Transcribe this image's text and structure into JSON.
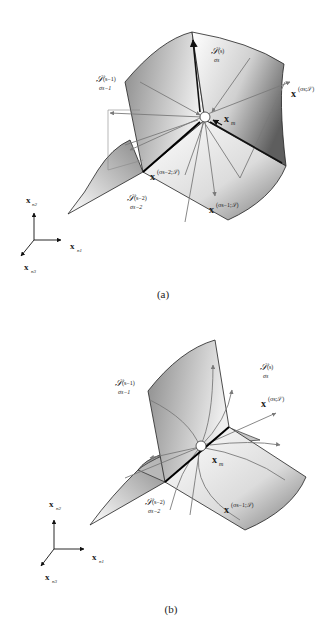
{
  "panels": [
    {
      "id": "a",
      "caption": "(a)",
      "labels": {
        "surface_s": "𝒮",
        "surface_s_sup": "(s)",
        "surface_s_sub": "σs",
        "surface_s1": "𝒮",
        "surface_s1_sup": "(s−1)",
        "surface_s1_sub": "σs−1",
        "surface_s2": "𝒮",
        "surface_s2_sup": "(s−2)",
        "surface_s2_sub": "σs−2",
        "x_sigma_s": "x",
        "x_sigma_s_sup": "(σs;𝒮)",
        "x_sigma_s1": "x",
        "x_sigma_s1_sup": "(σs−1;𝒮)",
        "x_sigma_s2": "x",
        "x_sigma_s2_sup": "(σs−2;𝒮)",
        "x_m": "x",
        "x_m_sub": "m"
      },
      "axes": {
        "n1": "x",
        "n1_sub": "n1",
        "n2": "x",
        "n2_sub": "n2",
        "n3": "x",
        "n3_sub": "n3"
      }
    },
    {
      "id": "b",
      "caption": "(b)",
      "labels": {
        "surface_s": "𝒮",
        "surface_s_sup": "(s)",
        "surface_s_sub": "σs",
        "surface_s1": "𝒮",
        "surface_s1_sup": "(s−1)",
        "surface_s1_sub": "σs−1",
        "surface_s2": "𝒮",
        "surface_s2_sup": "(s−2)",
        "surface_s2_sub": "σs−2",
        "x_sigma_s": "x",
        "x_sigma_s_sup": "(σs;𝒮)",
        "x_sigma_s1": "x",
        "x_sigma_s1_sup": "(σs−1;𝒮)",
        "x_m": "x",
        "x_m_sub": "m"
      },
      "axes": {
        "n1": "x",
        "n1_sub": "n1",
        "n2": "x",
        "n2_sub": "n2",
        "n3": "x",
        "n3_sub": "n3"
      }
    }
  ],
  "colors": {
    "surface_dark": "#6e6e6e",
    "surface_light": "#f2f2f2",
    "edge": "#222222",
    "arrow_gray": "#7a7a7a",
    "bold_edge": "#000000"
  }
}
